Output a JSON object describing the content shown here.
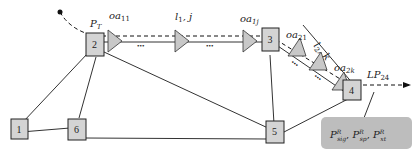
{
  "diagram": {
    "nodes": [
      {
        "id": "1",
        "label": "1",
        "x": 15,
        "y": 121
      },
      {
        "id": "2",
        "label": "2",
        "x": 93,
        "y": 45
      },
      {
        "id": "3",
        "label": "3",
        "x": 271,
        "y": 44
      },
      {
        "id": "4",
        "label": "4",
        "x": 353,
        "y": 90
      },
      {
        "id": "5",
        "label": "5",
        "x": 276,
        "y": 132
      },
      {
        "id": "6",
        "label": "6",
        "x": 77,
        "y": 128
      }
    ],
    "labels": {
      "pt": "P",
      "pt_sub": "T",
      "oa11": "oa",
      "oa11_sub": "11",
      "l1j": "l",
      "l1j_sub": "1",
      "l1j_rest": ", j",
      "oa1j": "oa",
      "oa1j_sub": "1j",
      "oa21": "oa",
      "oa21_sub": "21",
      "l2k": "l",
      "l2k_sub": "2",
      "l2k_rest": ", k",
      "oa2k": "oa",
      "oa2k_sub": "2k",
      "lp24": "LP",
      "lp24_sub": "24",
      "dots": "•••"
    },
    "result_box": {
      "p1": "P",
      "p1_sup": "R",
      "p1_sub": "sig",
      "p2": "P",
      "p2_sup": "R",
      "p2_sub": "sp",
      "p3": "P",
      "p3_sup": "R",
      "p3_sub": "xt",
      "sep": ", "
    },
    "colors": {
      "node_fill": "#d4d4d4",
      "amp_fill": "#c8c8c8",
      "box_fill": "#bdbdbd",
      "line": "#222222"
    }
  }
}
